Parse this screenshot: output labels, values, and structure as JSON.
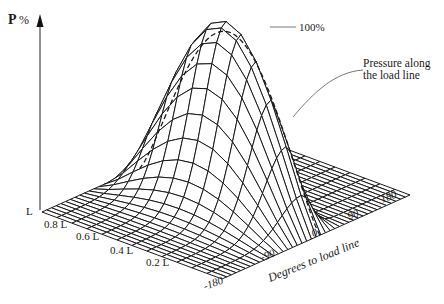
{
  "figure": {
    "y_axis_label_bold": "P",
    "y_axis_label_unit": "%",
    "peak_label": "100%",
    "annotation": "Pressure along the load line",
    "annotation_line1": "Pressure along",
    "annotation_line2": "the load line",
    "axis_length_title": "",
    "axis_degrees_title": "Degrees to load line",
    "length_ticks": [
      "L",
      "0.8 L",
      "0.6 L",
      "0.4 L",
      "0.2 L"
    ],
    "degree_ticks": [
      "-180",
      "-90",
      "0",
      "90",
      "180"
    ]
  },
  "chart_data": {
    "type": "surface",
    "title": "",
    "zlabel": "P %",
    "xlabel": "Degrees to load line",
    "ylabel": "Bearing length (fraction of L)",
    "x_ticks": [
      -180,
      -90,
      0,
      90,
      180
    ],
    "y_ticks": [
      "L",
      "0.8 L",
      "0.6 L",
      "0.4 L",
      "0.2 L"
    ],
    "x_range": [
      -180,
      180
    ],
    "y_range": [
      0,
      1
    ],
    "z_range": [
      0,
      100
    ],
    "peak": {
      "degrees": 0,
      "length_fraction": 0.5,
      "pressure_percent": 100
    },
    "annotations": [
      "100%",
      "Pressure along the load line"
    ]
  }
}
